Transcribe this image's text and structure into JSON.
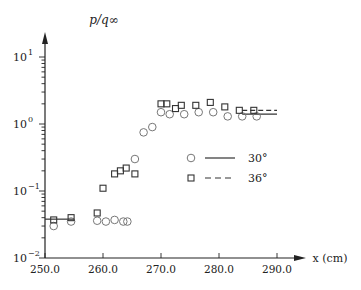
{
  "chart_data": {
    "type": "scatter",
    "title": "",
    "xlabel": "x (cm)",
    "ylabel": "p/q∞",
    "yscale": "log",
    "xlim": [
      250.0,
      295.0
    ],
    "ylim": [
      0.01,
      10
    ],
    "x_ticks": [
      250.0,
      260.0,
      270.0,
      280.0,
      290.0
    ],
    "x_tick_labels": [
      "250.0",
      "260.0",
      "270.0",
      "280.0",
      "290.0"
    ],
    "y_ticks": [
      0.01,
      0.1,
      1,
      10
    ],
    "y_tick_labels": [
      {
        "base": "10",
        "exp": "−2"
      },
      {
        "base": "10",
        "exp": "−1"
      },
      {
        "base": "10",
        "exp": "0"
      },
      {
        "base": "10",
        "exp": "1"
      }
    ],
    "grid": false,
    "legend_position": "right-middle",
    "series": [
      {
        "name": "30°",
        "marker": "circle",
        "line": "solid",
        "points": [
          [
            251.5,
            0.03
          ],
          [
            254.5,
            0.035
          ],
          [
            259.0,
            0.036
          ],
          [
            260.5,
            0.035
          ],
          [
            262.0,
            0.037
          ],
          [
            263.5,
            0.035
          ],
          [
            264.2,
            0.035
          ],
          [
            265.5,
            0.3
          ],
          [
            267.0,
            0.75
          ],
          [
            268.5,
            0.9
          ],
          [
            270.0,
            1.5
          ],
          [
            271.5,
            1.4
          ],
          [
            274.0,
            1.4
          ],
          [
            276.5,
            1.5
          ],
          [
            279.0,
            1.5
          ],
          [
            281.5,
            1.3
          ],
          [
            284.0,
            1.3
          ],
          [
            286.5,
            1.3
          ]
        ],
        "line_segments": [
          [
            [
              250.0,
              0.038
            ],
            [
              255.0,
              0.038
            ]
          ],
          [
            [
              284.0,
              1.4
            ],
            [
              290.0,
              1.4
            ]
          ]
        ]
      },
      {
        "name": "36°",
        "marker": "square",
        "line": "dashed",
        "points": [
          [
            251.5,
            0.037
          ],
          [
            254.5,
            0.04
          ],
          [
            259.0,
            0.047
          ],
          [
            260.0,
            0.11
          ],
          [
            262.0,
            0.18
          ],
          [
            263.0,
            0.2
          ],
          [
            264.0,
            0.22
          ],
          [
            265.5,
            0.18
          ],
          [
            270.0,
            2.0
          ],
          [
            271.0,
            2.0
          ],
          [
            272.5,
            1.7
          ],
          [
            273.5,
            1.9
          ],
          [
            276.0,
            1.9
          ],
          [
            278.5,
            2.1
          ],
          [
            281.0,
            1.8
          ],
          [
            283.5,
            1.6
          ],
          [
            286.0,
            1.6
          ]
        ],
        "line_segments": [
          [
            [
              284.0,
              1.6
            ],
            [
              290.0,
              1.6
            ]
          ]
        ]
      }
    ]
  },
  "axes": {
    "ylabel": "p/q∞",
    "xlabel": "x (cm)"
  },
  "legend": [
    {
      "label": "30°",
      "marker": "circle",
      "line": "solid"
    },
    {
      "label": "36°",
      "marker": "square",
      "line": "dashed"
    }
  ],
  "colors": {
    "axis": "#222222",
    "circle": "#777777",
    "square": "#333333",
    "line": "#333333"
  }
}
